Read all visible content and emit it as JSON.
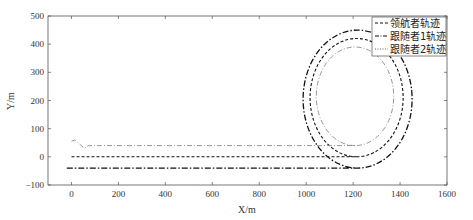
{
  "chart_data": {
    "type": "line",
    "title": "",
    "xlabel": "X/m",
    "ylabel": "Y/m",
    "xlim": [
      -100,
      1600
    ],
    "ylim": [
      -100,
      500
    ],
    "xticks": [
      0,
      200,
      400,
      600,
      800,
      1000,
      1200,
      1400,
      1600
    ],
    "yticks": [
      -100,
      0,
      100,
      200,
      300,
      400,
      500
    ],
    "grid": false,
    "legend_position": "top-right",
    "series": [
      {
        "name": "领航者轨迹",
        "style": "dashed",
        "color": "#111111",
        "start": [
          0,
          0
        ],
        "straight_end_x": 1215,
        "loop": {
          "cx": 1215,
          "cy": 210,
          "rx": 198,
          "ry": 210
        },
        "points": [
          [
            0,
            0
          ],
          [
            1215,
            0
          ],
          [
            1413,
            210
          ],
          [
            1215,
            420
          ],
          [
            1017,
            210
          ],
          [
            1215,
            0
          ]
        ]
      },
      {
        "name": "跟随者1轨迹",
        "style": "dash-dot",
        "color": "#111111",
        "start": [
          -20,
          -40
        ],
        "straight_end_x": 1219,
        "loop": {
          "cx": 1219,
          "cy": 205,
          "rx": 232,
          "ry": 245
        },
        "points": [
          [
            -20,
            -40
          ],
          [
            1219,
            -40
          ],
          [
            1451,
            205
          ],
          [
            1219,
            450
          ],
          [
            987,
            205
          ],
          [
            1219,
            -40
          ]
        ]
      },
      {
        "name": "跟随者2轨迹",
        "style": "dash-dot-light",
        "color": "#8a8a8a",
        "start": [
          0,
          55
        ],
        "straight_end_x": 1208,
        "loop": {
          "cx": 1208,
          "cy": 215,
          "rx": 165,
          "ry": 175
        },
        "points": [
          [
            0,
            55
          ],
          [
            15,
            60
          ],
          [
            55,
            30
          ],
          [
            70,
            40
          ],
          [
            1208,
            40
          ],
          [
            1374,
            215
          ],
          [
            1208,
            390
          ],
          [
            1043,
            215
          ],
          [
            1208,
            40
          ]
        ]
      }
    ]
  },
  "axes": {
    "xlabel": "X/m",
    "ylabel": "Y/m",
    "xtick_labels": [
      "0",
      "200",
      "400",
      "600",
      "800",
      "1000",
      "1200",
      "1400",
      "1600"
    ],
    "ytick_labels": [
      "−100",
      "0",
      "100",
      "200",
      "300",
      "400",
      "500"
    ]
  },
  "legend": {
    "items": [
      {
        "label": "领航者轨迹"
      },
      {
        "label": "跟随者1轨迹"
      },
      {
        "label": "跟随者2轨迹"
      }
    ]
  }
}
